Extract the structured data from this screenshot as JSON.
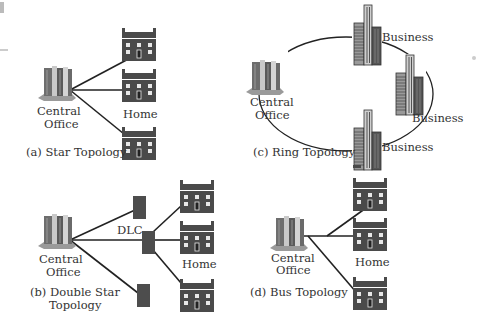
{
  "diagram": {
    "colors": {
      "line": "#222222",
      "house_fill": "#4a4a4a",
      "house_window": "#e8e8e8",
      "node_fill": "#4d4d4d",
      "text": "#333333"
    },
    "panels": [
      {
        "id": "a",
        "caption": "(a) Star Topology",
        "central_office_label_line1": "Central",
        "central_office_label_line2": "Office",
        "node_label": "Home"
      },
      {
        "id": "b",
        "caption_line1": "(b) Double Star",
        "caption_line2": "Topology",
        "central_office_label_line1": "Central",
        "central_office_label_line2": "Office",
        "hub_label": "DLC",
        "node_label": "Home"
      },
      {
        "id": "c",
        "caption": "(c) Ring Topology",
        "central_office_label_line1": "Central",
        "central_office_label_line2": "Office",
        "node_labels": [
          "Business",
          "Business",
          "Business"
        ]
      },
      {
        "id": "d",
        "caption": "(d) Bus Topology",
        "central_office_label_line1": "Central",
        "central_office_label_line2": "Office",
        "node_label": "Home"
      }
    ]
  }
}
